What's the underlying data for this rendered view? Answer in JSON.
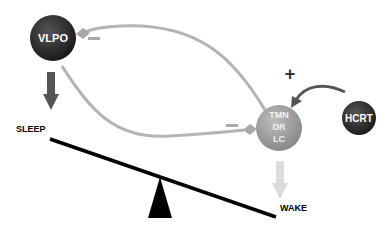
{
  "nodes": {
    "vlpo": {
      "label": "VLPO",
      "color": "#2a2a2a"
    },
    "tmn": {
      "lines": [
        "TMN",
        "DR",
        "LC"
      ],
      "color": "#9a9a9a"
    },
    "hcrt": {
      "label": "HCRT",
      "color": "#2e2e2e"
    }
  },
  "states": {
    "sleep": "SLEEP",
    "wake": "WAKE"
  },
  "signs": {
    "inhibit_vlpo": "−",
    "inhibit_tmn": "−",
    "excite_tmn": "+"
  },
  "colors": {
    "inhibitory_path": "#b4b4b4",
    "excitatory_path": "#555555",
    "sleep_arrow": "#555555",
    "wake_arrow": "#dcdcdc",
    "seesaw": "#000000"
  }
}
